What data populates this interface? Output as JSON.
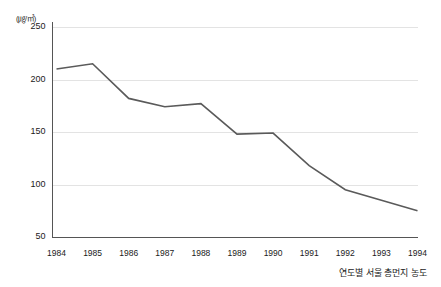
{
  "chart_data": {
    "type": "line",
    "title": "",
    "subtitle": "",
    "caption": "연도별 서울 총먼지 농도",
    "unit_label": "(㎍/㎥)",
    "xlabel": "",
    "ylabel": "",
    "categories": [
      "1984",
      "1985",
      "1986",
      "1987",
      "1988",
      "1989",
      "1990",
      "1991",
      "1992",
      "1993",
      "1994"
    ],
    "values": [
      210,
      215,
      182,
      174,
      177,
      148,
      149,
      118,
      95,
      85,
      75
    ],
    "series": [
      {
        "name": "연도별 서울 총먼지 농도",
        "values": [
          210,
          215,
          182,
          174,
          177,
          148,
          149,
          118,
          95,
          85,
          75
        ]
      }
    ],
    "ylim": [
      50,
      250
    ],
    "y_ticks": [
      250,
      200,
      150,
      100,
      50
    ],
    "x_ticks": [
      "1984",
      "1985",
      "1986",
      "1987",
      "1988",
      "1989",
      "1990",
      "1991",
      "1992",
      "1993",
      "1994"
    ],
    "grid": true,
    "grid_axis": "y",
    "legend": false,
    "legend_position": "none",
    "line_color": "#5a5a5a",
    "grid_color": "#e3e3e3",
    "axis_color": "#555555",
    "background_color": "#ffffff"
  }
}
